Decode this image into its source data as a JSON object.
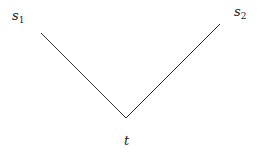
{
  "diagram": {
    "nodes": [
      {
        "id": "s1",
        "base": "s",
        "sub": "1",
        "x": 12,
        "y": 9
      },
      {
        "id": "s2",
        "base": "s",
        "sub": "2",
        "x": 234,
        "y": 5
      },
      {
        "id": "t",
        "base": "t",
        "sub": "",
        "x": 124,
        "y": 134
      }
    ],
    "edges": [
      {
        "from": "s1",
        "to": "t",
        "x1": 41,
        "y1": 33,
        "x2": 126,
        "y2": 118
      },
      {
        "from": "t",
        "to": "s2",
        "x1": 126,
        "y1": 118,
        "x2": 220,
        "y2": 24
      }
    ],
    "line_color": "#333333"
  },
  "labels": {
    "s1_base": "s",
    "s1_sub": "1",
    "s2_base": "s",
    "s2_sub": "2",
    "t_base": "t"
  }
}
